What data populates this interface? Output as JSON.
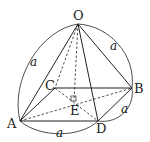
{
  "diagram": {
    "type": "square pyramid",
    "vertices": {
      "O": {
        "label": "O",
        "x": 78,
        "y": 24
      },
      "A": {
        "label": "A",
        "x": 20,
        "y": 121
      },
      "B": {
        "label": "B",
        "x": 132,
        "y": 88
      },
      "C": {
        "label": "C",
        "x": 55,
        "y": 88
      },
      "D": {
        "label": "D",
        "x": 98,
        "y": 121
      },
      "E": {
        "label": "E",
        "x": 74,
        "y": 101
      }
    },
    "edge_length_labels": {
      "OA": "a",
      "OB": "a",
      "AD": "a",
      "DB": "a"
    },
    "colors": {
      "line": "#222222",
      "background": "#ffffff"
    }
  }
}
